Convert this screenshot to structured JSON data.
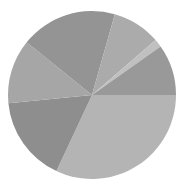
{
  "chart_data": {
    "type": "pie",
    "title": "",
    "center": [
      92,
      95
    ],
    "radius": 84,
    "start_angle_deg": 0,
    "direction": "clockwise",
    "slices": [
      {
        "label": "",
        "value": 31.0,
        "color": "#b4b4b4"
      },
      {
        "label": "",
        "value": 16.0,
        "color": "#8e8e8e"
      },
      {
        "label": "",
        "value": 12.0,
        "color": "#a6a6a6"
      },
      {
        "label": "",
        "value": 18.0,
        "color": "#949494"
      },
      {
        "label": "",
        "value": 9.0,
        "color": "#ababab"
      },
      {
        "label": "",
        "value": 1.5,
        "color": "#c0c0c0"
      },
      {
        "label": "",
        "value": 9.5,
        "color": "#999999"
      }
    ],
    "legend": "none",
    "grid": false
  }
}
